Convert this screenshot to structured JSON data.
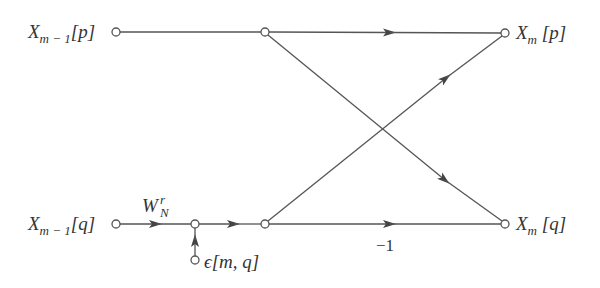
{
  "diagram": {
    "type": "flow-graph",
    "colors": {
      "line": "#555555",
      "text": "#333333",
      "background": "#ffffff"
    },
    "inputs": {
      "top": {
        "base": "X",
        "sub": "m − 1",
        "index": "[p]"
      },
      "bottom": {
        "base": "X",
        "sub": "m − 1",
        "index": "[q]"
      }
    },
    "outputs": {
      "top": {
        "base": "X",
        "sub": "m",
        "index": "[p]"
      },
      "bottom": {
        "base": "X",
        "sub": "m",
        "index": "[q]"
      }
    },
    "twiddle": {
      "base": "W",
      "sup": "r",
      "sub": "N"
    },
    "noise": {
      "label": "ϵ[m, q]"
    },
    "gain_bottom": "−1",
    "nodes": [
      {
        "id": "in-p",
        "x": 116,
        "y": 32
      },
      {
        "id": "mid-p",
        "x": 265,
        "y": 32
      },
      {
        "id": "out-p",
        "x": 505,
        "y": 33
      },
      {
        "id": "in-q",
        "x": 116,
        "y": 224
      },
      {
        "id": "sum-q",
        "x": 195,
        "y": 224
      },
      {
        "id": "mid-q",
        "x": 265,
        "y": 224
      },
      {
        "id": "out-q",
        "x": 505,
        "y": 224
      },
      {
        "id": "noise",
        "x": 195,
        "y": 260
      }
    ]
  }
}
